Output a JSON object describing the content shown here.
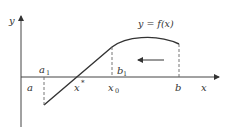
{
  "diagram": {
    "title_label": "y = f(x)",
    "axes": {
      "x_label": "x",
      "y_label": "y"
    },
    "points": {
      "a": "a",
      "a1": "a",
      "a1_sub": "1",
      "x_star": "x",
      "x_star_sup": "*",
      "x0": "x",
      "x0_sub": "0",
      "b1": "b",
      "b1_sub": "1",
      "b": "b"
    },
    "arrow_direction": "left",
    "colors": {
      "line": "#333333",
      "dash": "#555555",
      "background": "#ffffff"
    }
  }
}
